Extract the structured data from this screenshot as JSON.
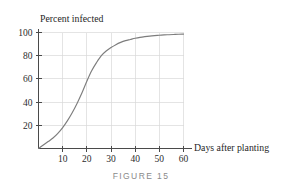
{
  "figure": {
    "caption": "FIGURE 15"
  },
  "chart_data": {
    "type": "line",
    "title": "",
    "subtitle": "",
    "xlabel": "Days after planting",
    "ylabel": "Percent infected",
    "ylabel_position": "above-axis",
    "xlim": [
      0,
      62
    ],
    "ylim": [
      0,
      104
    ],
    "grid": true,
    "grid_color": "#d8d8d8",
    "legend": null,
    "legend_position": "none",
    "curve_color": "#7d7d7d",
    "axis_color": "#4a4a4a",
    "xticks": [
      10,
      20,
      30,
      40,
      50,
      60
    ],
    "xtick_labels": [
      "10",
      "20",
      "30",
      "40",
      "50",
      "60"
    ],
    "yticks": [
      20,
      40,
      60,
      80,
      100
    ],
    "ytick_labels": [
      "20",
      "40",
      "60",
      "80",
      "100"
    ],
    "series": [
      {
        "name": "Percent infected",
        "x": [
          0,
          2,
          4,
          6,
          8,
          10,
          12,
          14,
          16,
          18,
          20,
          22,
          24,
          26,
          28,
          30,
          32,
          34,
          36,
          38,
          40,
          42,
          44,
          46,
          48,
          50,
          52,
          54,
          56,
          58,
          60
        ],
        "values": [
          0,
          3,
          6,
          9,
          13,
          18,
          24,
          31,
          39,
          48,
          58,
          67,
          74,
          80,
          84,
          87,
          89.5,
          91.5,
          93,
          94,
          95,
          95.8,
          96.4,
          96.9,
          97.3,
          97.6,
          97.9,
          98.1,
          98.3,
          98.5,
          98.6
        ]
      }
    ]
  }
}
